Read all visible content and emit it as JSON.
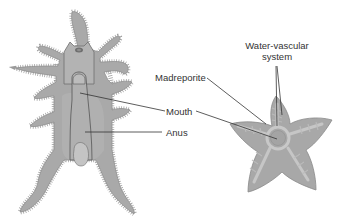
{
  "diagram": {
    "left_figure": "bipinnaria-larva",
    "right_figure": "adult-sea-star",
    "labels": {
      "madreporite": "Madreporite",
      "mouth": "Mouth",
      "anus": "Anus",
      "water_vascular_line1": "Water-vascular",
      "water_vascular_line2": "system"
    },
    "colors": {
      "body_fill": "#a9a9a9",
      "body_light": "#bdbdbd",
      "body_dark": "#8f8f8f",
      "outline": "#7a7a7a",
      "cilia": "#8a8a8a",
      "leader_line": "#333333",
      "text": "#333333",
      "background": "#ffffff"
    }
  }
}
